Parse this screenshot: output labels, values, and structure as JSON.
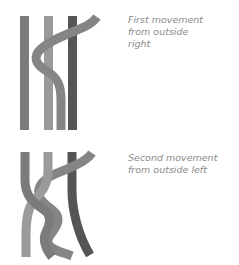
{
  "steps": [
    {
      "caption": "First movement\nfrom outside\nright"
    },
    {
      "caption": "Second movement\nfrom outside left"
    }
  ],
  "colors": {
    "strand_left": "#7b7b7b",
    "strand_mid": "#9a9a9a",
    "strand_moving": "#858585",
    "strand_right": "#555555",
    "caption": "#8a8a8a"
  }
}
